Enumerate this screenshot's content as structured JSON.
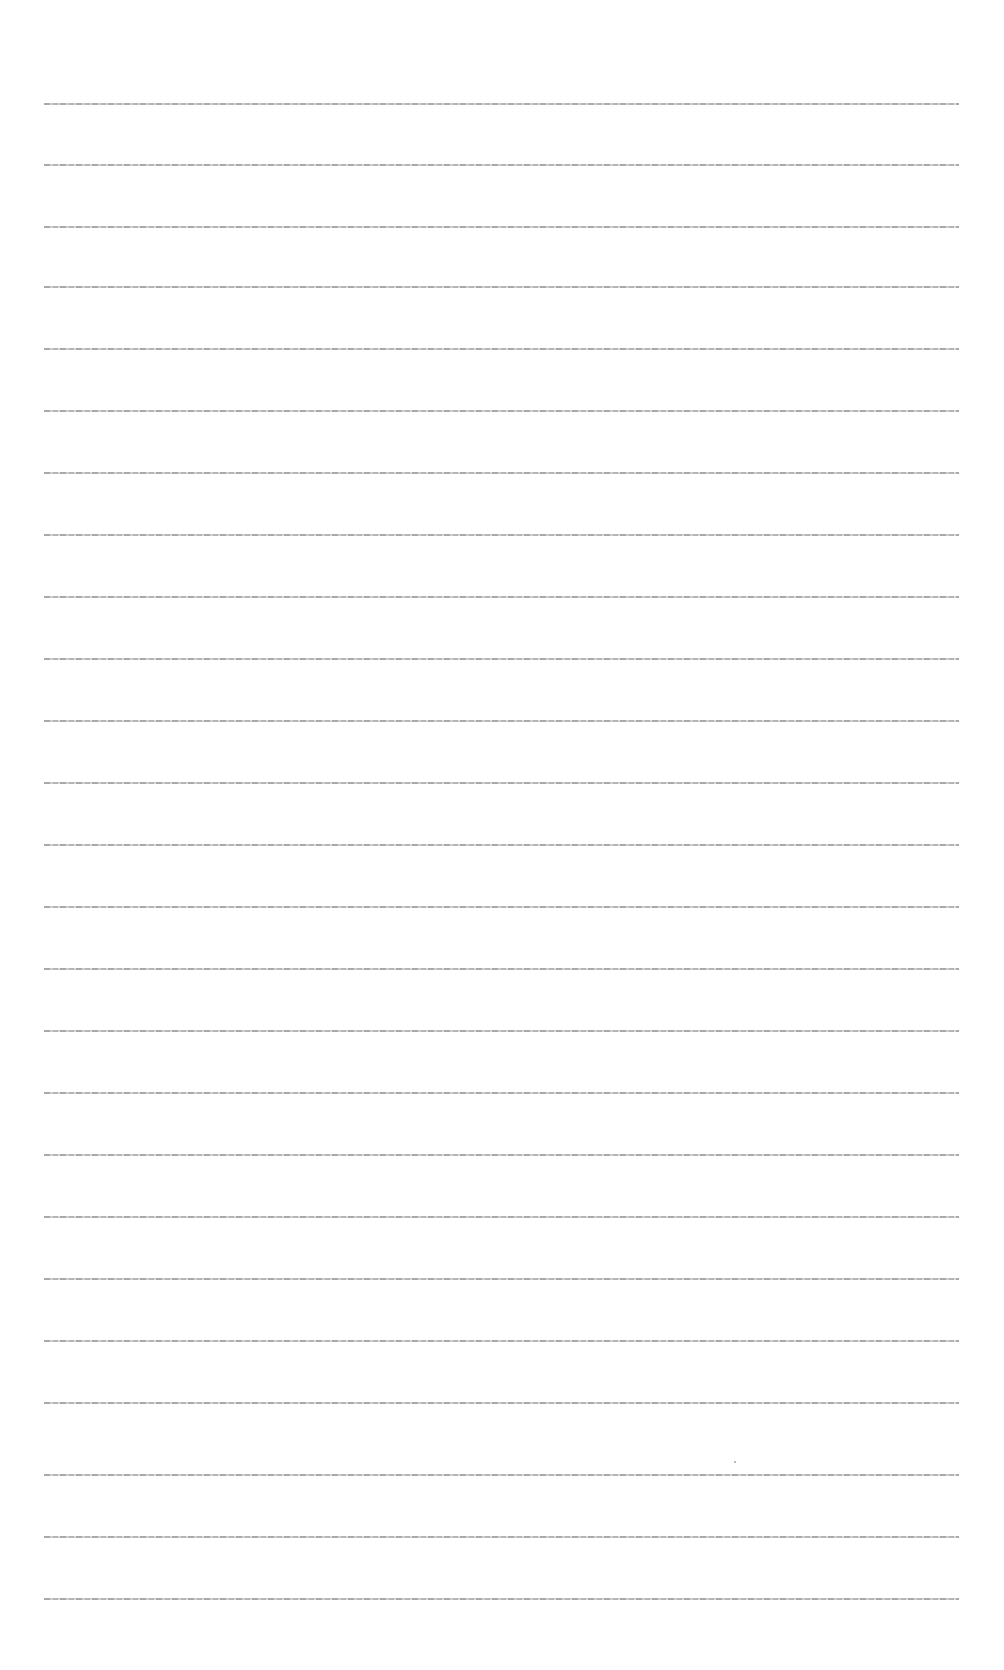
{
  "document": {
    "line_count": 25,
    "lines": [
      {
        "top": 103,
        "text": ""
      },
      {
        "top": 164,
        "text": ""
      },
      {
        "top": 226,
        "text": ""
      },
      {
        "top": 286,
        "text": ""
      },
      {
        "top": 348,
        "text": ""
      },
      {
        "top": 410,
        "text": ""
      },
      {
        "top": 472,
        "text": ""
      },
      {
        "top": 534,
        "text": ""
      },
      {
        "top": 596,
        "text": ""
      },
      {
        "top": 658,
        "text": ""
      },
      {
        "top": 720,
        "text": ""
      },
      {
        "top": 782,
        "text": ""
      },
      {
        "top": 844,
        "text": ""
      },
      {
        "top": 906,
        "text": ""
      },
      {
        "top": 968,
        "text": ""
      },
      {
        "top": 1030,
        "text": ""
      },
      {
        "top": 1092,
        "text": ""
      },
      {
        "top": 1154,
        "text": ""
      },
      {
        "top": 1216,
        "text": ""
      },
      {
        "top": 1278,
        "text": ""
      },
      {
        "top": 1340,
        "text": ""
      },
      {
        "top": 1402,
        "text": ""
      },
      {
        "top": 1474,
        "text": ""
      },
      {
        "top": 1536,
        "text": ""
      },
      {
        "top": 1598,
        "text": ""
      }
    ]
  }
}
